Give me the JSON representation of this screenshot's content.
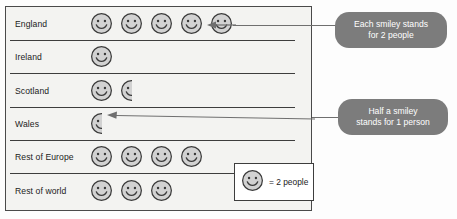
{
  "chart_data": {
    "type": "pictogram",
    "title": "",
    "xlabel": "",
    "ylabel": "",
    "unit_value": 2,
    "unit_label": "people",
    "icon": "smiley-face-icon",
    "categories": [
      "England",
      "Ireland",
      "Scotland",
      "Wales",
      "Rest of Europe",
      "Rest of world"
    ],
    "icon_counts": [
      5,
      1,
      1.5,
      0.5,
      4,
      3
    ],
    "values": [
      10,
      2,
      3,
      1,
      8,
      6
    ],
    "key": {
      "icon": "smiley-face-icon",
      "text": "= 2 people"
    },
    "annotations": [
      {
        "id": "callout-1",
        "text": "Each smiley stands for 2 people",
        "line1": "Each smiley stands",
        "line2": "for 2 people",
        "points_to": "England"
      },
      {
        "id": "callout-2",
        "text": "Half a smiley stands for 1 person",
        "line1": "Half a smiley",
        "line2": "stands for 1 person",
        "points_to": "Wales"
      }
    ]
  },
  "colors": {
    "frame_border": "#4a4a4a",
    "chart_background": "#f3f3f1",
    "row_rule": "#3d3d3d",
    "label_text": "#1b1b1b",
    "callout_fill": "#7c7c7c",
    "callout_text": "#ffffff",
    "smiley_fill": "#d2d2d2",
    "smiley_stroke": "#3a3a3a",
    "leader_line": "#6f6f6f",
    "key_box_fill": "#ffffff"
  },
  "rows": [
    {
      "label": "England",
      "icons": 5,
      "half": false
    },
    {
      "label": "Ireland",
      "icons": 1,
      "half": false
    },
    {
      "label": "Scotland",
      "icons": 1.5,
      "half": true
    },
    {
      "label": "Wales",
      "icons": 0.5,
      "half": true
    },
    {
      "label": "Rest of Europe",
      "icons": 4,
      "half": false
    },
    {
      "label": "Rest of world",
      "icons": 3,
      "half": false
    }
  ]
}
